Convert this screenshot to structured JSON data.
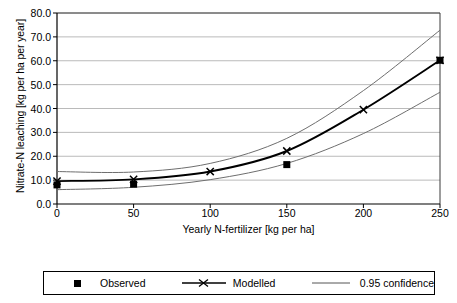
{
  "chart_data": {
    "type": "line",
    "title": "",
    "xlabel": "Yearly N-fertilizer [kg per ha]",
    "ylabel": "Nitrate-N leaching [kg per ha per year]",
    "xlim": [
      0,
      250
    ],
    "ylim": [
      0,
      80
    ],
    "xticks": [
      "0",
      "50",
      "100",
      "150",
      "200",
      "250"
    ],
    "xtick_values": [
      0,
      50,
      100,
      150,
      200,
      250
    ],
    "yticks": [
      "0.0",
      "10.0",
      "20.0",
      "30.0",
      "40.0",
      "50.0",
      "60.0",
      "70.0",
      "80.0"
    ],
    "ytick_values": [
      0,
      10,
      20,
      30,
      40,
      50,
      60,
      70,
      80
    ],
    "grid": "horizontal",
    "legend_position": "below-plot",
    "series": [
      {
        "name": "Observed",
        "marker": "filled-square",
        "line": "none",
        "color": "#000000",
        "x": [
          0,
          50,
          150,
          250
        ],
        "values": [
          8.0,
          8.3,
          16.5,
          60.2
        ]
      },
      {
        "name": "Modelled",
        "marker": "x-cross",
        "line": "solid-thick",
        "color": "#000000",
        "x": [
          0,
          50,
          100,
          150,
          200,
          250
        ],
        "values": [
          9.6,
          10.3,
          13.6,
          22.2,
          39.5,
          60.2
        ]
      },
      {
        "name": "0.95 confidence",
        "marker": "none",
        "line": "solid-thin",
        "color": "#808080",
        "bound": "upper",
        "x": [
          0,
          50,
          100,
          150,
          200,
          250
        ],
        "values": [
          13.6,
          13.4,
          17.0,
          27.5,
          47.5,
          72.8
        ]
      },
      {
        "name": "0.95 confidence",
        "marker": "none",
        "line": "solid-thin",
        "color": "#808080",
        "bound": "lower",
        "x": [
          0,
          50,
          100,
          150,
          200,
          250
        ],
        "values": [
          6.0,
          7.0,
          10.2,
          17.0,
          29.5,
          46.8
        ]
      }
    ]
  },
  "legend": {
    "items": [
      {
        "label": "Observed",
        "key": "square-marker-key"
      },
      {
        "label": "Modelled",
        "key": "line-x-marker-key"
      },
      {
        "label": "0.95 confidence",
        "key": "plain-line-key"
      }
    ]
  }
}
